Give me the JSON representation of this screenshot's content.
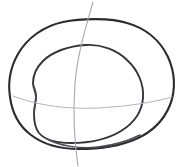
{
  "image": {
    "kind": "hand-drawn-sketch",
    "subject": "rounded-shell-contour-study",
    "background_color": "#ffffff",
    "width": 181,
    "height": 167,
    "caption": ""
  },
  "palette": {
    "paper": "#ffffff",
    "ink_dark": "#2b2b30",
    "ink_medium": "#33333a",
    "ink_soft": "#4a4a52",
    "guide_gray": "#a9a9ae",
    "guide_gray_soft": "#b4b4b8"
  },
  "strokes": {
    "outer_contour": {
      "label": "outer shell outline",
      "color": "#2b2b30",
      "width": 2.1,
      "closed": true,
      "path": "M 63 22 C 44 26 27 38 18 54 C 10 68 8 84 10 97 C 12 112 19 126 31 135 C 44 145 61 149 79 149 C 99 149 120 146 136 139 C 152 132 164 120 170 105 C 176 90 175 72 168 57 C 160 40 145 28 127 23 C 111 18 82 18 63 22 Z"
    },
    "inner_contour": {
      "label": "inner shell outline with notched left edge",
      "color": "#33333a",
      "width": 1.9,
      "closed": true,
      "path": "M 86 45 C 68 46 52 52 43 61 C 36 68 33 76 33 83 C 33 88 36 92 36 97 C 36 103 34 107 34 114 C 34 121 35 128 39 133 C 45 140 57 143 71 143 C 89 143 108 139 121 131 C 134 123 142 111 143 98 C 144 84 138 70 127 60 C 117 50 101 44 86 45 Z"
    },
    "inner_notch_accent": {
      "label": "left edge notch reinforcement",
      "color": "#4a4a52",
      "width": 1.5,
      "path": "M 33 84 C 35 90 37 93 36 98 C 35 104 34 108 34 115"
    },
    "bottom_overlap_accent": {
      "label": "bottom overlap line",
      "color": "#4a4a52",
      "width": 1.5,
      "path": "M 47 139 C 60 146 80 149 98 147 C 116 145 130 140 140 135"
    },
    "guide_vertical": {
      "label": "vertical construction guide arc",
      "color": "#a9a9ae",
      "width": 1.1,
      "path": "M 93 2 C 85 30 77 56 75 84 C 73 112 74 140 78 166"
    },
    "guide_horizontal": {
      "label": "horizontal construction guide arc",
      "color": "#b4b4b8",
      "width": 1.0,
      "path": "M 13 96 C 45 108 78 110 112 107 C 138 105 158 101 172 97"
    }
  }
}
